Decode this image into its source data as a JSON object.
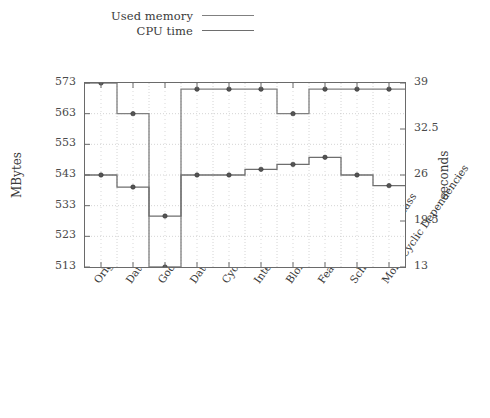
{
  "chart_data": {
    "type": "line",
    "title": "",
    "subtitle": "",
    "xlabel": "",
    "ylabel": "MBytes",
    "y2label": "seconds",
    "grid": true,
    "legend_position": "top",
    "step_style": "step-mid",
    "markers": true,
    "categories": [
      "Original",
      "Data Clumps",
      "God Class",
      "Data Class",
      "Cyclic Dependencies",
      "Intensive Coupling",
      "Blob Operation",
      "Feature Envy",
      "Schizophrenic Class",
      "More Cyclic Dependencies"
    ],
    "ylim": [
      513,
      573
    ],
    "yticks": [
      513,
      523,
      533,
      543,
      553,
      563,
      573
    ],
    "y2lim": [
      13,
      39
    ],
    "y2ticks": [
      13,
      19.5,
      26,
      32.5,
      39
    ],
    "series": [
      {
        "name": "Used memory",
        "axis": "left",
        "units": "MBytes",
        "color": "#808080",
        "values": [
          573,
          563,
          513,
          571,
          571,
          571,
          563,
          571,
          571,
          571
        ]
      },
      {
        "name": "CPU time",
        "axis": "right",
        "units": "seconds",
        "color": "#6e6e6e",
        "values": [
          26,
          24.3,
          20.2,
          26,
          26,
          26.8,
          27.5,
          28.5,
          26,
          24.5
        ]
      }
    ]
  },
  "legend": {
    "items": [
      {
        "label": "Used memory"
      },
      {
        "label": "CPU time"
      }
    ]
  },
  "axes": {
    "left_title": "MBytes",
    "right_title": "seconds"
  },
  "colors": {
    "memory_line": "#808080",
    "cpu_line": "#6e6e6e",
    "frame": "#6a6a6a",
    "grid": "#c9c9c9",
    "text": "#3a3a3a",
    "background": "#ffffff"
  }
}
